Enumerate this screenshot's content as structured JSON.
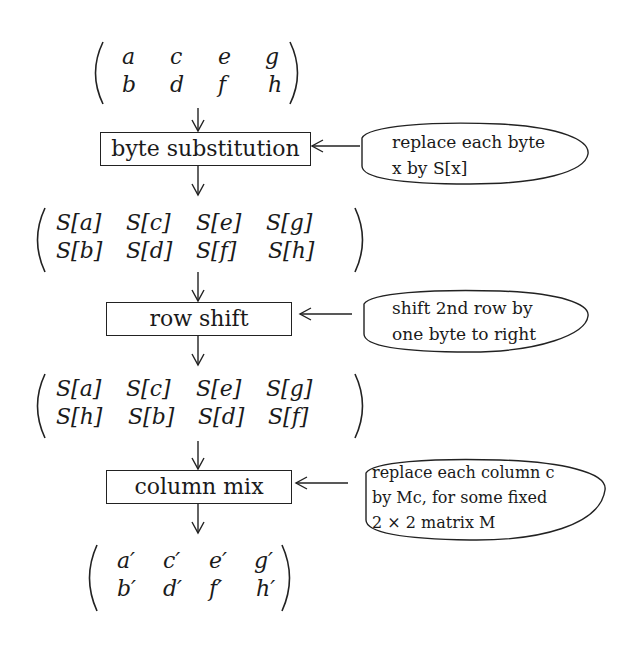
{
  "diagram": {
    "title": "",
    "matrices": [
      {
        "id": "input",
        "rows": [
          [
            "a",
            "c",
            "e",
            "g"
          ],
          [
            "b",
            "d",
            "f",
            "h"
          ]
        ]
      },
      {
        "id": "after-byte-substitution",
        "rows": [
          [
            "S[a]",
            "S[c]",
            "S[e]",
            "S[g]"
          ],
          [
            "S[b]",
            "S[d]",
            "S[f]",
            "S[h]"
          ]
        ]
      },
      {
        "id": "after-row-shift",
        "rows": [
          [
            "S[a]",
            "S[c]",
            "S[e]",
            "S[g]"
          ],
          [
            "S[h]",
            "S[b]",
            "S[d]",
            "S[f]"
          ]
        ]
      },
      {
        "id": "output",
        "rows": [
          [
            "a′",
            "c′",
            "e′",
            "g′"
          ],
          [
            "b′",
            "d′",
            "f′",
            "h′"
          ]
        ]
      }
    ],
    "steps": [
      {
        "label": "byte substitution",
        "note_lines": [
          "replace each byte",
          "x by S[x]"
        ]
      },
      {
        "label": "row shift",
        "note_lines": [
          "shift 2nd row by",
          "one byte to right"
        ]
      },
      {
        "label": "column mix",
        "note_lines": [
          "replace each column c",
          "by Mc, for some fixed",
          "2 × 2 matrix M"
        ]
      }
    ],
    "colors": {
      "ink": "#1a1a1a",
      "background": "#ffffff"
    }
  }
}
